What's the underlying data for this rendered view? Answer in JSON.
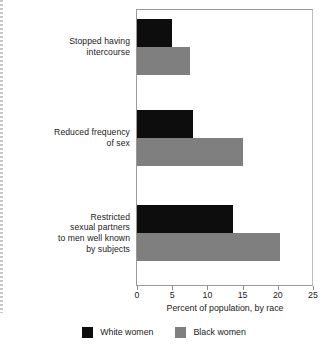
{
  "chart_data": {
    "type": "bar",
    "orientation": "horizontal",
    "title": "",
    "xlabel": "Percent of population, by race",
    "ylabel": "",
    "xlim": [
      0,
      25
    ],
    "xticks": [
      0,
      5,
      10,
      15,
      20,
      25
    ],
    "xtick_labels": [
      "0",
      "5",
      "10",
      "15",
      "20",
      "25"
    ],
    "grid": false,
    "legend_position": "bottom",
    "categories": [
      "Stopped having intercourse",
      "Reduced frequency of sex",
      "Restricted sexual partners to men well known by subjects"
    ],
    "category_label_lines": [
      [
        "Stopped having",
        "intercourse"
      ],
      [
        "Reduced frequency",
        "of sex"
      ],
      [
        "Restricted",
        "sexual partners",
        "to men well known",
        "by subjects"
      ]
    ],
    "series": [
      {
        "name": "White women",
        "color": "#0d0d0d",
        "values": [
          5.0,
          8.0,
          13.7
        ]
      },
      {
        "name": "Black women",
        "color": "#7f7f7f",
        "values": [
          7.5,
          15.0,
          20.3
        ]
      }
    ]
  },
  "legend": {
    "entries": [
      {
        "label": "White women",
        "swatch": "black-swatch"
      },
      {
        "label": "Black women",
        "swatch": "gray-swatch"
      }
    ]
  },
  "axis": {
    "x_title": "Percent of population, by race",
    "tick_labels": [
      "0",
      "5",
      "10",
      "15",
      "20",
      "25"
    ]
  },
  "caption": {
    "clipped_line": ""
  }
}
